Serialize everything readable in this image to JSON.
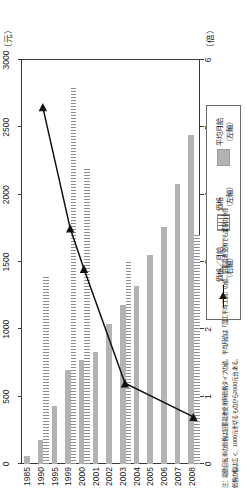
{
  "chart_data": {
    "type": "bar",
    "title": "",
    "orientation": "horizontal",
    "categories": [
      "1985",
      "1990",
      "1995",
      "1999",
      "2000",
      "2001",
      "2002",
      "2003",
      "2004",
      "2005",
      "2006",
      "2007",
      "2008"
    ],
    "series": [
      {
        "name": "平均月給（左軸）",
        "axis": "left",
        "unit": "元",
        "style": "solid-gray-bar",
        "values": [
          60,
          180,
          430,
          700,
          770,
          830,
          1040,
          1180,
          1320,
          1550,
          1760,
          2080,
          2440
        ]
      },
      {
        "name": "価格（左軸）",
        "axis": "left",
        "unit": "元",
        "style": "hatched-bar",
        "values": [
          null,
          1400,
          null,
          2800,
          2200,
          null,
          null,
          1500,
          null,
          null,
          null,
          null,
          1700
        ]
      },
      {
        "name": "価格／月給（右軸）",
        "axis": "right",
        "unit": "倍",
        "style": "line-with-triangle-markers",
        "values": [
          null,
          5.3,
          null,
          3.5,
          2.9,
          null,
          null,
          1.2,
          null,
          null,
          null,
          null,
          0.7
        ]
      }
    ],
    "xlabel_top": "（元）",
    "xlabel_bottom": "（倍）",
    "ylabel": "",
    "xticks_top": [
      "0",
      "500",
      "1000",
      "1500",
      "2000",
      "2500",
      "3000"
    ],
    "xticks_top_values": [
      0,
      500,
      1000,
      1500,
      2000,
      2500,
      3000
    ],
    "xlim_top": [
      0,
      3000
    ],
    "xticks_bottom": [
      "0",
      "1",
      "2",
      "3",
      "4",
      "5",
      "6"
    ],
    "xticks_bottom_values": [
      0,
      1,
      2,
      3,
      4,
      5,
      6
    ],
    "xlim_bottom": [
      0,
      6
    ],
    "grid": false,
    "legend_position": "bottom-right"
  },
  "legend": {
    "items": [
      {
        "label": "平均月給\n（左軸）",
        "swatch": "solid-bar-icon"
      },
      {
        "label": "価格\n（左軸）",
        "swatch": "hatched-bar-icon"
      },
      {
        "label": "価格／月給\n（右軸）",
        "swatch": "line-marker-icon"
      }
    ],
    "item0_line1": "平均月給",
    "item0_line2": "（左軸）",
    "item1_line1": "価格",
    "item1_line2": "（左軸）",
    "item2_line1": "価格／月給",
    "item2_line2": "（右軸）"
  },
  "axes": {
    "unit_top": "（元）",
    "unit_bottom": "（倍）"
  },
  "footnote": {
    "line1": "注：電動自転車の価格は鉛蓄電池使用時価格タイプの値。平均月給は「国工平均工資」の値。鉛蓄電池使用でも業界の小売",
    "line2": "価格の幅は広く、1000元を切るものから2000元台ある。"
  }
}
